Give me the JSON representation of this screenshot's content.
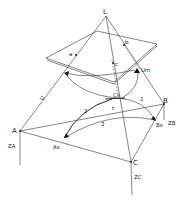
{
  "diagram": {
    "type": "geometric-projection-sketch",
    "labels": {
      "apex": "L",
      "plane_point_a": "a",
      "plane_point_b": "b",
      "plane_point_c": "c",
      "vertex_A": "A",
      "vertex_B": "B",
      "vertex_C": "C",
      "column_A": "ZA",
      "column_B": "ZB",
      "column_C": "ZC",
      "point_As": "As",
      "point_Bs": "Bs",
      "point_Cs": "Cs",
      "edge_U": "U",
      "label_Um": "Um",
      "arc_1": "1",
      "arc_2": "2",
      "arc_2s": "2̃",
      "mark_t": "t"
    }
  }
}
